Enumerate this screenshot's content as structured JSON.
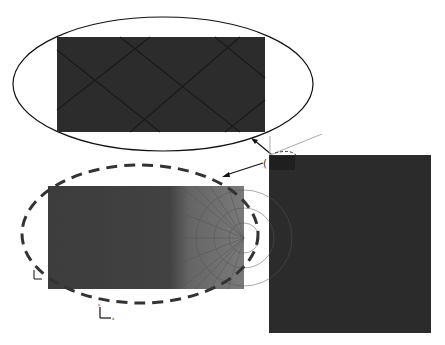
{
  "figure": {
    "colors": {
      "mesh_dark": "#2a2a2a",
      "mesh_medium": "#555555",
      "mesh_light": "#8a8a8a",
      "outline": "#111111",
      "axis_gray": "#aaaaaa",
      "background": "#ffffff"
    },
    "views": [
      {
        "name": "full-model",
        "label": ""
      },
      {
        "name": "top-detail",
        "label": ""
      },
      {
        "name": "left-detail",
        "label": ""
      }
    ],
    "axis_labels": {
      "x": "x",
      "y": "y"
    }
  }
}
